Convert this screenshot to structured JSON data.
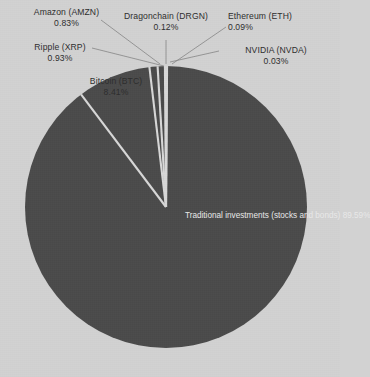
{
  "chart_data": {
    "type": "pie",
    "title": "",
    "subtitle": "",
    "xlabel": "",
    "ylabel": "",
    "legend_position": "none",
    "grid": false,
    "label_format": "name + percent",
    "categories": [
      "Ethereum (ETH)",
      "NVIDIA (NVDA)",
      "Traditional investments (stocks and bonds)",
      "Bitcoin (BTC)",
      "Ripple (XRP)",
      "Amazon  (AMZN)",
      "Dragonchain (DRGN)"
    ],
    "values": [
      0.09,
      0.03,
      89.59,
      8.41,
      0.93,
      0.83,
      0.12
    ],
    "slices": [
      {
        "id": "ethereum",
        "name": "Ethereum (ETH)",
        "percent_label": "0.09%",
        "value": 0.09,
        "color": "#4b4b4b",
        "label_placement": "outside-top-right",
        "label_align": "left"
      },
      {
        "id": "nvidia",
        "name": "NVIDIA (NVDA)",
        "percent_label": "0.03%",
        "value": 0.03,
        "color": "#4b4b4b",
        "label_placement": "outside-right",
        "label_align": "center"
      },
      {
        "id": "traditional-investments",
        "name": "Traditional investments",
        "name_line2": "(stocks and bonds)",
        "percent_label": "89.59%",
        "value": 89.59,
        "color": "#4b4b4b",
        "label_placement": "inside",
        "label_align": "center"
      },
      {
        "id": "bitcoin",
        "name": "Bitcoin (BTC)",
        "percent_label": "8.41%",
        "value": 8.41,
        "color": "#4b4b4b",
        "label_placement": "inside-upper-left",
        "label_align": "center"
      },
      {
        "id": "ripple",
        "name": "Ripple (XRP)",
        "percent_label": "0.93%",
        "value": 0.93,
        "color": "#4b4b4b",
        "label_placement": "outside-left",
        "label_align": "center"
      },
      {
        "id": "amazon",
        "name": "Amazon  (AMZN)",
        "percent_label": "0.83%",
        "value": 0.83,
        "color": "#4b4b4b",
        "label_placement": "outside-top-left",
        "label_align": "center"
      },
      {
        "id": "dragonchain",
        "name": "Dragonchain (DRGN)",
        "percent_label": "0.12%",
        "value": 0.12,
        "color": "#4b4b4b",
        "label_placement": "outside-top",
        "label_align": "center"
      }
    ]
  },
  "style": {
    "background_color": "#d2d2d2",
    "slice_color": "#4b4b4b",
    "separator_color": "#d8d8d8",
    "outside_label_color": "#2e2e2e",
    "inside_label_color": "#e8e8e8",
    "leader_line_color": "#8a8a8a"
  },
  "geometry": {
    "center_x": 166,
    "center_y": 207,
    "radius": 141,
    "start_angle_deg": 0
  }
}
